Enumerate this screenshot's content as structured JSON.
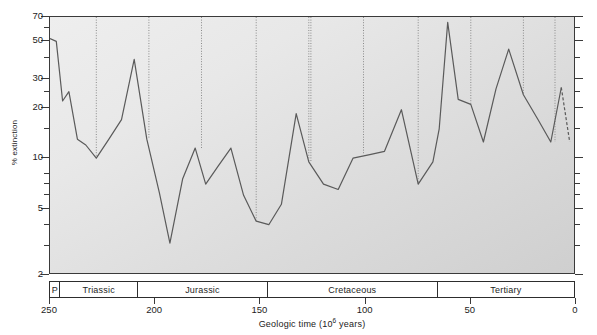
{
  "chart_data": {
    "type": "line",
    "title": "",
    "xlabel": "Geologic time (10^6 years)",
    "ylabel": "% extinction",
    "xlim": [
      250,
      0
    ],
    "ylim": [
      2,
      70
    ],
    "yscale": "log",
    "grid": false,
    "legend": null,
    "x_ticks": [
      250,
      200,
      150,
      100,
      50,
      0
    ],
    "y_ticks_major": [
      70,
      50,
      30,
      20,
      10,
      5,
      2
    ],
    "y_ticks_minor": [
      60,
      40,
      25,
      15,
      8,
      7,
      6,
      4,
      3
    ],
    "period_bands": [
      {
        "label": "P",
        "start": 250,
        "end": 245
      },
      {
        "label": "Triassic",
        "start": 245,
        "end": 208
      },
      {
        "label": "Jurassic",
        "start": 208,
        "end": 146
      },
      {
        "label": "Cretaceous",
        "start": 146,
        "end": 65
      },
      {
        "label": "Tertiary",
        "start": 65,
        "end": 0
      }
    ],
    "stage_boundary_lines": [
      228,
      203,
      178,
      152,
      127,
      126,
      101,
      75,
      50,
      25,
      10
    ],
    "series": [
      {
        "name": "% extinction",
        "x": [
          250,
          247,
          244,
          241,
          237,
          233,
          228,
          222,
          216,
          210,
          204,
          198,
          193,
          187,
          181,
          176,
          170,
          164,
          158,
          152,
          146,
          140,
          133,
          127,
          120,
          113,
          106,
          98,
          91,
          83,
          75,
          68,
          65,
          61,
          56,
          50,
          44,
          38,
          32,
          25,
          18,
          12,
          7,
          3
        ],
        "y": [
          52,
          50,
          22,
          25,
          13,
          12,
          10,
          13,
          17,
          39,
          13,
          6.2,
          3.1,
          7.5,
          11.5,
          7.0,
          9.0,
          11.5,
          6.0,
          4.2,
          4.0,
          5.3,
          18.5,
          9.5,
          7.0,
          6.5,
          10.0,
          10.5,
          11.0,
          19.5,
          7.0,
          9.5,
          15.0,
          65,
          22.5,
          21.0,
          12.5,
          26.0,
          45.0,
          24.0,
          17.0,
          12.5,
          26.5,
          12.5
        ]
      }
    ],
    "annotations": {
      "terminal_segment_style": "dashed"
    },
    "colors": {
      "line": "#5a5a5a",
      "axis": "#3a3a3a",
      "plot_bg_light": "#eeeeee",
      "plot_bg_dark": "#cfcfcf",
      "boundary_line": "#8a8a8a",
      "text": "#1d1d1d"
    }
  }
}
